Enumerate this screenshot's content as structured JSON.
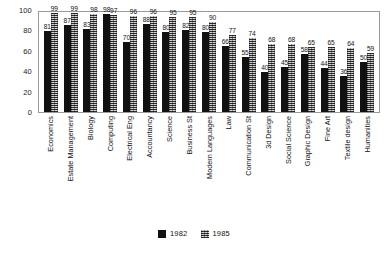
{
  "chart_data": {
    "type": "bar",
    "title": "",
    "subtitle": "",
    "xlabel": "",
    "ylabel": "",
    "ylim": [
      0,
      100
    ],
    "yticks": [
      0,
      20,
      40,
      60,
      80,
      100
    ],
    "grid": false,
    "legend_position": "bottom",
    "categories": [
      "Economics",
      "Estate Management",
      "Biology",
      "Computing",
      "Electrical Eng",
      "Accountancy",
      "Science",
      "Business St",
      "Modern Languages",
      "Law",
      "Communication St",
      "3d Design",
      "Social Science",
      "Graphic Design",
      "Fine Art",
      "Textile design",
      "Humanities"
    ],
    "series": [
      {
        "name": "1982",
        "color": "#111111",
        "values": [
          81,
          87,
          83,
          98,
          70,
          88,
          80,
          82,
          80,
          66,
          55,
          40,
          45,
          58,
          44,
          36,
          50
        ]
      },
      {
        "name": "1985",
        "color": "#8d8d8d",
        "values": [
          99,
          99,
          98,
          97,
          96,
          96,
          95,
          95,
          90,
          77,
          74,
          68,
          68,
          65,
          65,
          64,
          59
        ]
      }
    ]
  },
  "legend": {
    "entries": [
      {
        "label": "1982"
      },
      {
        "label": "1985"
      }
    ]
  }
}
